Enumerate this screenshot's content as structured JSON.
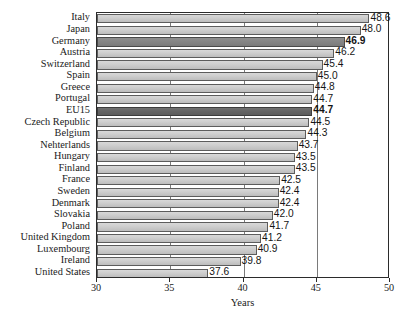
{
  "chart_data": {
    "type": "bar",
    "orientation": "horizontal",
    "title": "",
    "xlabel": "Years",
    "ylabel": "",
    "xlim": [
      30,
      50
    ],
    "xticks": [
      30,
      35,
      40,
      45,
      50
    ],
    "grid": true,
    "legend": null,
    "categories": [
      "Italy",
      "Japan",
      "Germany",
      "Austria",
      "Switzerland",
      "Spain",
      "Greece",
      "Portugal",
      "EU15",
      "Czech Republic",
      "Belgium",
      "Nehterlands",
      "Hungary",
      "Finland",
      "France",
      "Sweden",
      "Denmark",
      "Slovakia",
      "Poland",
      "United Kingdom",
      "Luxembourg",
      "Ireland",
      "United States"
    ],
    "values": [
      48.6,
      48.0,
      46.9,
      46.2,
      45.4,
      45.0,
      44.8,
      44.7,
      44.7,
      44.5,
      44.3,
      43.7,
      43.5,
      43.5,
      42.5,
      42.4,
      42.4,
      42.0,
      41.7,
      41.2,
      40.9,
      39.8,
      37.6
    ],
    "value_labels": [
      "48.6",
      "48.0",
      "46.9",
      "46.2",
      "45.4",
      "45.0",
      "44.8",
      "44.7",
      "44.7",
      "44.5",
      "44.3",
      "43.7",
      "43.5",
      "43.5",
      "42.5",
      "42.4",
      "42.4",
      "42.0",
      "41.7",
      "41.2",
      "40.9",
      "39.8",
      "37.6"
    ],
    "highlighted": [
      "Germany",
      "EU15"
    ],
    "highlight_styles": {
      "Germany": "highlight-a",
      "EU15": "highlight-b"
    },
    "colors": {
      "bar_fill": "#cfcfcf",
      "bar_edge": "#5c5c5c",
      "highlight_a_fill": "#868686",
      "highlight_b_fill": "#666666",
      "gridline": "#7a7a7a",
      "axis": "#2b2b2b",
      "text": "#1a1a1a"
    }
  }
}
